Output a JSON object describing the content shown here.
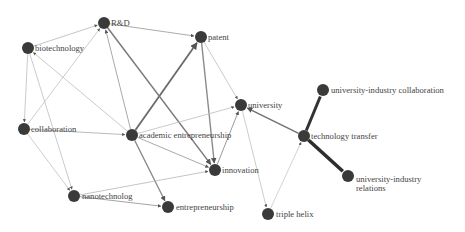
{
  "diagram": {
    "type": "directed-keyword-network",
    "node_color": "#3a3a3a",
    "node_radius": 6,
    "nodes": [
      {
        "id": "rd",
        "label": "R&D",
        "x": 104,
        "y": 23,
        "lx": 111,
        "ly": 26
      },
      {
        "id": "patent",
        "label": "patent",
        "x": 201,
        "y": 37,
        "lx": 208,
        "ly": 40
      },
      {
        "id": "biotechnology",
        "label": "biotechnology",
        "x": 28,
        "y": 48,
        "lx": 35,
        "ly": 51
      },
      {
        "id": "collaboration",
        "label": "collaboration",
        "x": 24,
        "y": 129,
        "lx": 31,
        "ly": 132
      },
      {
        "id": "academic_entrepreneurship",
        "label": "academic entrepreneurship",
        "x": 132,
        "y": 135,
        "lx": 139,
        "ly": 138
      },
      {
        "id": "university",
        "label": "university",
        "x": 241,
        "y": 105,
        "lx": 248,
        "ly": 108
      },
      {
        "id": "technology_transfer",
        "label": "technology transfer",
        "x": 304,
        "y": 136,
        "lx": 311,
        "ly": 139
      },
      {
        "id": "uic",
        "label": "university-industry collaboration",
        "x": 323,
        "y": 90,
        "lx": 331,
        "ly": 93
      },
      {
        "id": "uir",
        "label": "university-industry",
        "label2": "relations",
        "x": 348,
        "y": 176,
        "lx": 356,
        "ly": 182,
        "ly2": 191
      },
      {
        "id": "innovation",
        "label": "innovation",
        "x": 215,
        "y": 170,
        "lx": 222,
        "ly": 173
      },
      {
        "id": "nanotechnology",
        "label": "nanotechnolog",
        "x": 74,
        "y": 196,
        "lx": 82,
        "ly": 199
      },
      {
        "id": "entrepreneurship",
        "label": "entrepreneurship",
        "x": 168,
        "y": 207,
        "lx": 176,
        "ly": 210
      },
      {
        "id": "triple_helix",
        "label": "triple helix",
        "x": 268,
        "y": 214,
        "lx": 276,
        "ly": 217
      }
    ],
    "edges": [
      {
        "from": "biotechnology",
        "to": "rd",
        "width": 0.8,
        "color": "#b5b5b5"
      },
      {
        "from": "rd",
        "to": "patent",
        "width": 0.9,
        "color": "#a0a0a0"
      },
      {
        "from": "academic_entrepreneurship",
        "to": "patent",
        "width": 1.8,
        "color": "#6a6a6a"
      },
      {
        "from": "rd",
        "to": "innovation",
        "width": 1.5,
        "color": "#7a7a7a"
      },
      {
        "from": "academic_entrepreneurship",
        "to": "rd",
        "width": 1.0,
        "color": "#a8a8a8"
      },
      {
        "from": "collaboration",
        "to": "rd",
        "width": 0.8,
        "color": "#c0c0c0"
      },
      {
        "from": "patent",
        "to": "innovation",
        "width": 1.4,
        "color": "#8a8a8a"
      },
      {
        "from": "patent",
        "to": "university",
        "width": 0.8,
        "color": "#bdbdbd"
      },
      {
        "from": "biotechnology",
        "to": "collaboration",
        "width": 0.8,
        "color": "#bdbdbd"
      },
      {
        "from": "biotechnology",
        "to": "nanotechnology",
        "width": 0.8,
        "color": "#bdbdbd"
      },
      {
        "from": "academic_entrepreneurship",
        "to": "biotechnology",
        "width": 0.8,
        "color": "#bdbdbd"
      },
      {
        "from": "collaboration",
        "to": "academic_entrepreneurship",
        "width": 0.8,
        "color": "#a8a8a8"
      },
      {
        "from": "collaboration",
        "to": "nanotechnology",
        "width": 0.8,
        "color": "#c0c0c0"
      },
      {
        "from": "academic_entrepreneurship",
        "to": "university",
        "width": 0.8,
        "color": "#bdbdbd"
      },
      {
        "from": "academic_entrepreneurship",
        "to": "innovation",
        "width": 0.9,
        "color": "#a0a0a0"
      },
      {
        "from": "innovation",
        "to": "university",
        "width": 1.0,
        "color": "#9a9a9a"
      },
      {
        "from": "academic_entrepreneurship",
        "to": "entrepreneurship",
        "width": 1.3,
        "color": "#8a8a8a"
      },
      {
        "from": "nanotechnology",
        "to": "innovation",
        "width": 0.8,
        "color": "#b5b5b5"
      },
      {
        "from": "nanotechnology",
        "to": "entrepreneurship",
        "width": 0.9,
        "color": "#9a9a9a"
      },
      {
        "from": "technology_transfer",
        "to": "university",
        "width": 1.4,
        "color": "#707070"
      },
      {
        "from": "university",
        "to": "triple_helix",
        "width": 0.8,
        "color": "#c0c0c0"
      },
      {
        "from": "triple_helix",
        "to": "technology_transfer",
        "width": 0.8,
        "color": "#c8c8c8"
      },
      {
        "from": "technology_transfer",
        "to": "uic",
        "width": 3.0,
        "color": "#333333"
      },
      {
        "from": "technology_transfer",
        "to": "uir",
        "width": 3.6,
        "color": "#2e2e2e"
      }
    ]
  }
}
